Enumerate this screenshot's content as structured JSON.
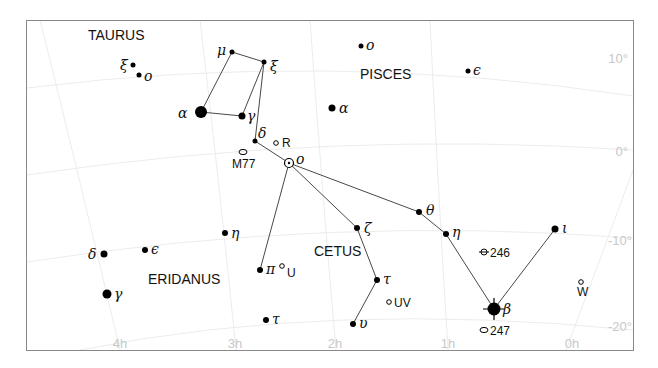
{
  "chart_data": {
    "type": "star-chart",
    "title": "",
    "frame": {
      "left": 26,
      "top": 20,
      "right": 634,
      "bottom": 350
    },
    "dec_labels": [
      {
        "label": "10°",
        "x": 628,
        "y": 63
      },
      {
        "label": "0°",
        "x": 628,
        "y": 156
      },
      {
        "label": "-10°",
        "x": 632,
        "y": 245
      },
      {
        "label": "-20°",
        "x": 632,
        "y": 331
      }
    ],
    "ra_labels": [
      {
        "label": "4h",
        "x": 120,
        "y": 348
      },
      {
        "label": "3h",
        "x": 235,
        "y": 348
      },
      {
        "label": "2h",
        "x": 335,
        "y": 348
      },
      {
        "label": "1h",
        "x": 448,
        "y": 348
      },
      {
        "label": "0h",
        "x": 572,
        "y": 348
      }
    ],
    "constellations": [
      {
        "name": "TAURUS",
        "x": 88,
        "y": 40
      },
      {
        "name": "PISCES",
        "x": 360,
        "y": 79
      },
      {
        "name": "CETUS",
        "x": 314,
        "y": 256
      },
      {
        "name": "ERIDANUS",
        "x": 148,
        "y": 284
      }
    ],
    "stars": [
      {
        "id": "tau-xi",
        "label": "ξ",
        "x": 133,
        "y": 65,
        "r": 2.5,
        "lx": 120,
        "ly": 70
      },
      {
        "id": "tau-o",
        "label": "o",
        "x": 139,
        "y": 75,
        "r": 2.5,
        "lx": 144,
        "ly": 81
      },
      {
        "id": "cet-mu",
        "label": "μ",
        "x": 232,
        "y": 52,
        "r": 2.5,
        "lx": 217,
        "ly": 55
      },
      {
        "id": "cet-xi",
        "label": "ξ",
        "x": 264,
        "y": 62,
        "r": 2.5,
        "lx": 270,
        "ly": 71
      },
      {
        "id": "cet-alpha",
        "label": "α",
        "x": 201,
        "y": 112,
        "r": 6,
        "lx": 178,
        "ly": 118
      },
      {
        "id": "cet-gamma",
        "label": "γ",
        "x": 242,
        "y": 116,
        "r": 3.5,
        "lx": 247,
        "ly": 121
      },
      {
        "id": "cet-delta",
        "label": "δ",
        "x": 255,
        "y": 141,
        "r": 2.5,
        "lx": 258,
        "ly": 138
      },
      {
        "id": "psc-o",
        "label": "o",
        "x": 361,
        "y": 46,
        "r": 2.5,
        "lx": 366,
        "ly": 50
      },
      {
        "id": "psc-alpha",
        "label": "α",
        "x": 332,
        "y": 108,
        "r": 3.5,
        "lx": 339,
        "ly": 113
      },
      {
        "id": "psc-epsilon",
        "label": "ϵ",
        "x": 468,
        "y": 71,
        "r": 2.5,
        "lx": 473,
        "ly": 75
      },
      {
        "id": "cet-zeta",
        "label": "ζ",
        "x": 357,
        "y": 228,
        "r": 3,
        "lx": 364,
        "ly": 233
      },
      {
        "id": "cet-theta",
        "label": "θ",
        "x": 419,
        "y": 212,
        "r": 3,
        "lx": 426,
        "ly": 215
      },
      {
        "id": "cet-eta",
        "label": "η",
        "x": 446,
        "y": 234,
        "r": 3,
        "lx": 452,
        "ly": 237
      },
      {
        "id": "cet-iota",
        "label": "ι",
        "x": 555,
        "y": 229,
        "r": 3.5,
        "lx": 562,
        "ly": 233
      },
      {
        "id": "cet-tau",
        "label": "τ",
        "x": 377,
        "y": 280,
        "r": 3,
        "lx": 383,
        "ly": 284
      },
      {
        "id": "cet-upsilon",
        "label": "υ",
        "x": 353,
        "y": 324,
        "r": 3,
        "lx": 359,
        "ly": 328
      },
      {
        "id": "cet-pi",
        "label": "π",
        "x": 260,
        "y": 270,
        "r": 3,
        "lx": 266,
        "ly": 274
      },
      {
        "id": "eri-eta",
        "label": "η",
        "x": 225,
        "y": 233,
        "r": 3,
        "lx": 231,
        "ly": 238
      },
      {
        "id": "eri-delta",
        "label": "δ",
        "x": 104,
        "y": 254,
        "r": 3.5,
        "lx": 88,
        "ly": 259
      },
      {
        "id": "eri-epsilon",
        "label": "ϵ",
        "x": 145,
        "y": 250,
        "r": 3,
        "lx": 151,
        "ly": 254
      },
      {
        "id": "eri-gamma",
        "label": "γ",
        "x": 107,
        "y": 294,
        "r": 4.5,
        "lx": 114,
        "ly": 299
      },
      {
        "id": "eri-tau",
        "label": "τ",
        "x": 266,
        "y": 320,
        "r": 3,
        "lx": 272,
        "ly": 324
      },
      {
        "id": "cet-beta",
        "label": "β",
        "x": 494,
        "y": 309,
        "r": 6.5,
        "lx": 503,
        "ly": 314
      }
    ],
    "variable_star": {
      "id": "cet-omicron-mira",
      "label": "o",
      "x": 289,
      "y": 163,
      "r": 4.5,
      "lx": 296,
      "ly": 164
    },
    "deep_sky": [
      {
        "label": "R",
        "type": "variable",
        "x": 276,
        "y": 143,
        "lx": 282,
        "ly": 147
      },
      {
        "label": "M77",
        "type": "galaxy",
        "x": 243,
        "y": 152,
        "lx": 232,
        "ly": 168
      },
      {
        "label": "U",
        "type": "variable",
        "x": 282,
        "y": 266,
        "lx": 287,
        "ly": 277
      },
      {
        "label": "UV",
        "type": "variable",
        "x": 389,
        "y": 302,
        "lx": 394,
        "ly": 307
      },
      {
        "label": "246",
        "type": "planetary",
        "x": 484,
        "y": 252,
        "lx": 490,
        "ly": 257
      },
      {
        "label": "247",
        "type": "galaxy",
        "x": 484,
        "y": 330,
        "lx": 490,
        "ly": 335
      },
      {
        "label": "W",
        "type": "variable",
        "x": 581,
        "y": 282,
        "lx": 577,
        "ly": 296
      }
    ],
    "figure_lines": [
      [
        [
          201,
          112
        ],
        [
          232,
          52
        ],
        [
          264,
          62
        ],
        [
          242,
          116
        ],
        [
          201,
          112
        ]
      ],
      [
        [
          264,
          62
        ],
        [
          255,
          141
        ],
        [
          289,
          163
        ]
      ],
      [
        [
          289,
          163
        ],
        [
          260,
          270
        ]
      ],
      [
        [
          289,
          163
        ],
        [
          357,
          228
        ],
        [
          377,
          280
        ],
        [
          353,
          324
        ]
      ],
      [
        [
          289,
          163
        ],
        [
          419,
          212
        ],
        [
          446,
          234
        ],
        [
          494,
          309
        ],
        [
          555,
          229
        ]
      ]
    ]
  }
}
